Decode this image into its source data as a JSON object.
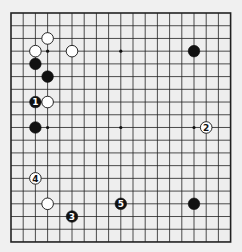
{
  "board": {
    "size": 19,
    "origin_x": 11,
    "origin_y": 13,
    "step_x": 12.2,
    "step_y": 12.72,
    "background": "#eeeeee",
    "line_color": "#222222",
    "stone_radius": 5.8
  },
  "star_points": [
    [
      3,
      3
    ],
    [
      9,
      3
    ],
    [
      15,
      3
    ],
    [
      3,
      9
    ],
    [
      9,
      9
    ],
    [
      15,
      9
    ],
    [
      3,
      15
    ],
    [
      9,
      15
    ],
    [
      15,
      15
    ]
  ],
  "stones": [
    {
      "color": "white",
      "x": 3,
      "y": 2,
      "label": ""
    },
    {
      "color": "white",
      "x": 2,
      "y": 3,
      "label": ""
    },
    {
      "color": "white",
      "x": 5,
      "y": 3,
      "label": ""
    },
    {
      "color": "black",
      "x": 2,
      "y": 4,
      "label": ""
    },
    {
      "color": "black",
      "x": 3,
      "y": 5,
      "label": ""
    },
    {
      "color": "black",
      "x": 2,
      "y": 7,
      "label": "1"
    },
    {
      "color": "white",
      "x": 3,
      "y": 7,
      "label": ""
    },
    {
      "color": "black",
      "x": 2,
      "y": 9,
      "label": ""
    },
    {
      "color": "black",
      "x": 15,
      "y": 3,
      "label": ""
    },
    {
      "color": "white",
      "x": 16,
      "y": 9,
      "label": "2"
    },
    {
      "color": "white",
      "x": 2,
      "y": 13,
      "label": "4"
    },
    {
      "color": "white",
      "x": 3,
      "y": 15,
      "label": ""
    },
    {
      "color": "black",
      "x": 5,
      "y": 16,
      "label": "3"
    },
    {
      "color": "black",
      "x": 9,
      "y": 15,
      "label": "5"
    },
    {
      "color": "black",
      "x": 15,
      "y": 15,
      "label": ""
    }
  ]
}
